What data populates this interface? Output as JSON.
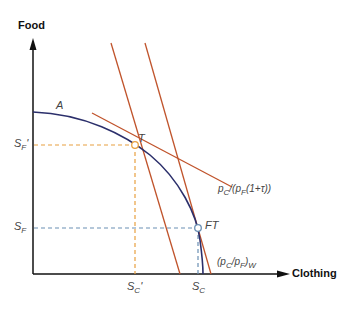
{
  "diagram": {
    "y_axis_label": "Food",
    "x_axis_label": "Clothing",
    "curve_label": "A",
    "points": {
      "tariff_point": "T",
      "free_trade_point": "FT"
    },
    "y_ticks": {
      "sf_prime": {
        "base": "S",
        "sub": "F",
        "suffix": "'"
      },
      "sf": {
        "base": "S",
        "sub": "F",
        "suffix": ""
      }
    },
    "x_ticks": {
      "sc_prime": {
        "base": "S",
        "sub": "C",
        "suffix": "'"
      },
      "sc": {
        "base": "S",
        "sub": "C",
        "suffix": ""
      }
    },
    "price_lines": {
      "tariff": {
        "p1": "p",
        "s1": "C",
        "mid": "/(p",
        "s2": "F",
        "tail": "(1+τ))"
      },
      "world": {
        "p1": "(p",
        "s1": "C",
        "mid": "/p",
        "s2": "F",
        "tail": ")",
        "s3": "W"
      }
    },
    "colors": {
      "ppf": "#2b2f6b",
      "price_line": "#c0532b",
      "dash_tariff": "#e8a040",
      "dash_world": "#6a8fb3",
      "axis": "#111111"
    }
  }
}
